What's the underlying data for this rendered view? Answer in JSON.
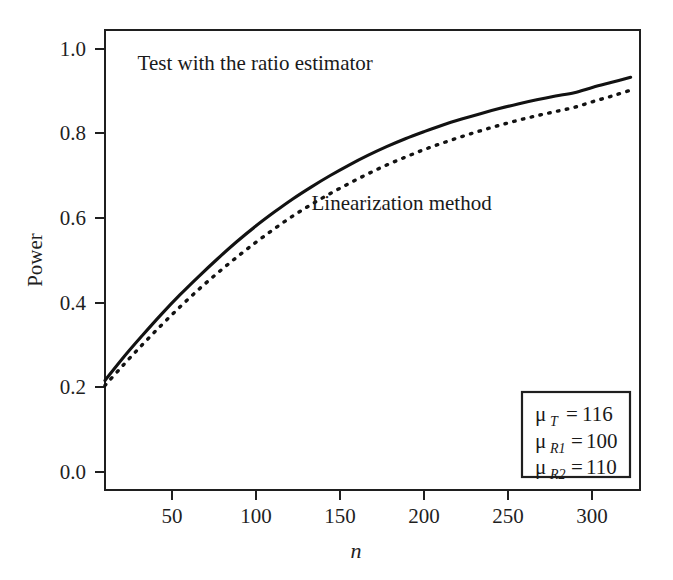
{
  "chart_data": {
    "type": "line",
    "title": "",
    "xlabel": "n",
    "ylabel": "Power",
    "xlim": [
      20,
      305
    ],
    "ylim": [
      -0.05,
      1.05
    ],
    "grid": false,
    "legend_position": "inline-annotations",
    "xticks": [
      50,
      100,
      150,
      200,
      250,
      300
    ],
    "xtick_labels": [
      "50",
      "100",
      "150",
      "200",
      "250",
      "300"
    ],
    "yticks": [
      0.0,
      0.2,
      0.4,
      0.6,
      0.8,
      1.0
    ],
    "ytick_labels": [
      "0.0",
      "0.2",
      "0.4",
      "0.6",
      "0.8",
      "1.0"
    ],
    "x": [
      20,
      30,
      40,
      50,
      60,
      70,
      80,
      90,
      100,
      110,
      120,
      130,
      140,
      150,
      160,
      170,
      180,
      190,
      200,
      210,
      220,
      230,
      240,
      250,
      260,
      270,
      280,
      290,
      300
    ],
    "series": [
      {
        "name": "Test with the ratio estimator",
        "style": "solid",
        "color": "#121212",
        "values": [
          0.212,
          0.268,
          0.32,
          0.37,
          0.417,
          0.461,
          0.503,
          0.543,
          0.58,
          0.614,
          0.646,
          0.675,
          0.702,
          0.727,
          0.75,
          0.771,
          0.79,
          0.807,
          0.823,
          0.837,
          0.85,
          0.862,
          0.873,
          0.883,
          0.892,
          0.9,
          0.913,
          0.925,
          0.937
        ]
      },
      {
        "name": "Linearization method",
        "style": "dashed",
        "color": "#121212",
        "values": [
          0.2,
          0.25,
          0.298,
          0.344,
          0.388,
          0.43,
          0.469,
          0.506,
          0.541,
          0.574,
          0.605,
          0.633,
          0.659,
          0.683,
          0.706,
          0.727,
          0.746,
          0.764,
          0.78,
          0.795,
          0.809,
          0.822,
          0.834,
          0.845,
          0.855,
          0.865,
          0.879,
          0.892,
          0.906
        ]
      }
    ],
    "annotations": [
      {
        "text": "Test with the ratio estimator",
        "x": 100,
        "y": 0.955
      },
      {
        "text": "Linearization method",
        "x": 178,
        "y": 0.62
      }
    ]
  },
  "legend_box": {
    "rows": [
      {
        "symbol": "μ",
        "subscript": "T",
        "equals": "=",
        "value": "116"
      },
      {
        "symbol": "μ",
        "subscript": "R1",
        "equals": "=",
        "value": "100"
      },
      {
        "symbol": "μ",
        "subscript": "R2",
        "equals": "=",
        "value": "110"
      }
    ]
  }
}
